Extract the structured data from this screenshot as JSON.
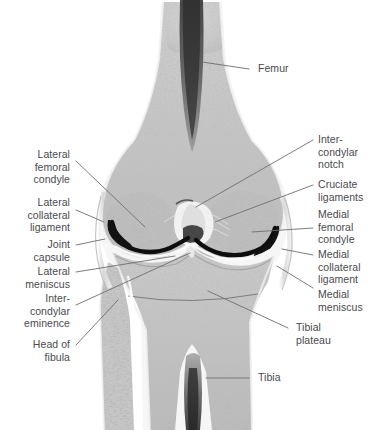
{
  "figure": {
    "kind": "anatomical-illustration",
    "background_color": "#ffffff",
    "text_color": "#4a4a4e",
    "leader_line_color": "#6e6e73"
  },
  "labels": {
    "femur": "Femur",
    "intercondylar_notch": "Inter-\ncondylar\nnotch",
    "cruciate_ligaments": "Cruciate\nligaments",
    "medial_femoral_condyle": "Medial\nfemoral\ncondyle",
    "medial_collateral_ligament": "Medial\ncollateral\nligament",
    "medial_meniscus": "Medial\nmeniscus",
    "tibial_plateau": "Tibial\nplateau",
    "tibia": "Tibia",
    "lateral_femoral_condyle": "Lateral\nfemoral\ncondyle",
    "lateral_collateral_ligament": "Lateral\ncollateral\nligament",
    "joint_capsule": "Joint\ncapsule",
    "lateral_meniscus": "Lateral\nmeniscus",
    "intercondylar_eminence": "Inter-\ncondylar\neminence",
    "head_of_fibula": "Head of\nfibula"
  }
}
